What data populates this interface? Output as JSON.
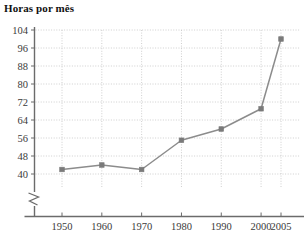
{
  "chart_data": {
    "type": "line",
    "title": "Horas por mês",
    "xlabel": "",
    "ylabel": "",
    "x": [
      1950,
      1960,
      1970,
      1980,
      1990,
      2000,
      2005
    ],
    "xtick_labels": [
      "1950",
      "1960",
      "1970",
      "1980",
      "1990",
      "2000",
      "2005"
    ],
    "values": [
      42,
      44,
      42,
      55,
      60,
      69,
      100
    ],
    "series": [
      {
        "name": "Horas por mês",
        "values": [
          42,
          44,
          42,
          55,
          60,
          69,
          100
        ]
      }
    ],
    "ytick_labels": [
      "104",
      "96",
      "88",
      "80",
      "72",
      "64",
      "56",
      "48",
      "40"
    ],
    "yticks": [
      104,
      96,
      88,
      80,
      72,
      64,
      56,
      48,
      40
    ],
    "ylim": [
      40,
      104
    ],
    "xlim": [
      1945,
      2008
    ],
    "grid": true,
    "grid_style": "dotted",
    "legend": "none",
    "axis_break": "y-axis zigzag below 40",
    "marker": "square",
    "colors": {
      "line": "#8c8c8c",
      "marker": "#7a7a7a",
      "grid": "#c9c9c9",
      "axis": "#6b6b6b",
      "text": "#3a3a3a",
      "title": "#111111",
      "background": "#ffffff"
    }
  }
}
